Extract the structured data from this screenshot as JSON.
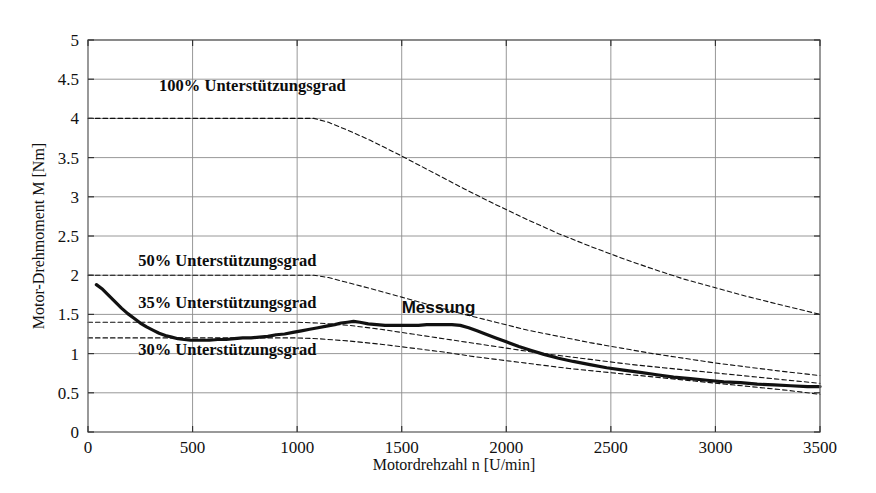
{
  "chart_data": {
    "type": "line",
    "title": "",
    "xlabel": "Motordrehzahl n [U/min]",
    "ylabel": "Motor-Drehmoment M [Nm]",
    "xlim": [
      0,
      3500
    ],
    "ylim": [
      0,
      5
    ],
    "xticks": [
      0,
      500,
      1000,
      1500,
      2000,
      2500,
      3000,
      3500
    ],
    "yticks": [
      0,
      0.5,
      1,
      1.5,
      2,
      2.5,
      3,
      3.5,
      4,
      4.5,
      5
    ],
    "xtick_labels": [
      "0",
      "500",
      "1000",
      "1500",
      "2000",
      "2500",
      "3000",
      "3500"
    ],
    "ytick_labels": [
      "0",
      "0.5",
      "1",
      "1.5",
      "2",
      "2.5",
      "3",
      "3.5",
      "4",
      "4.5",
      "5"
    ],
    "grid": true,
    "legend_position": "inline-annotations",
    "series": [
      {
        "name": "100% Unterstützungsgrad",
        "style": "dashed",
        "color": "#111111",
        "x": [
          0,
          200,
          400,
          600,
          800,
          1000,
          1080,
          1150,
          1250,
          1350,
          1500,
          1650,
          1800,
          1950,
          2100,
          2250,
          2400,
          2550,
          2700,
          2850,
          3000,
          3150,
          3300,
          3500
        ],
        "y": [
          4.0,
          4.0,
          4.0,
          4.0,
          4.0,
          4.0,
          4.0,
          3.95,
          3.84,
          3.72,
          3.52,
          3.31,
          3.1,
          2.9,
          2.71,
          2.53,
          2.37,
          2.22,
          2.08,
          1.95,
          1.84,
          1.73,
          1.63,
          1.5
        ]
      },
      {
        "name": "50% Unterstützungsgrad",
        "style": "dashed",
        "color": "#111111",
        "x": [
          0,
          200,
          400,
          600,
          800,
          1000,
          1080,
          1150,
          1250,
          1350,
          1500,
          1650,
          1800,
          1950,
          2100,
          2250,
          2400,
          2550,
          2700,
          2850,
          3000,
          3150,
          3300,
          3500
        ],
        "y": [
          2.0,
          2.0,
          2.0,
          2.0,
          2.0,
          2.0,
          2.0,
          1.97,
          1.9,
          1.83,
          1.72,
          1.61,
          1.5,
          1.4,
          1.3,
          1.22,
          1.14,
          1.07,
          1.0,
          0.94,
          0.88,
          0.83,
          0.78,
          0.72
        ]
      },
      {
        "name": "35% Unterstützungsgrad",
        "style": "dashed",
        "color": "#111111",
        "x": [
          0,
          200,
          400,
          600,
          800,
          1000,
          1100,
          1250,
          1400,
          1550,
          1700,
          1850,
          2000,
          2150,
          2300,
          2450,
          2600,
          2750,
          2900,
          3050,
          3200,
          3350,
          3500
        ],
        "y": [
          1.4,
          1.4,
          1.4,
          1.4,
          1.4,
          1.4,
          1.39,
          1.36,
          1.31,
          1.25,
          1.19,
          1.13,
          1.07,
          1.01,
          0.96,
          0.91,
          0.86,
          0.82,
          0.78,
          0.74,
          0.7,
          0.66,
          0.62
        ]
      },
      {
        "name": "30% Unterstützungsgrad",
        "style": "dashed",
        "color": "#111111",
        "x": [
          0,
          200,
          400,
          600,
          800,
          1000,
          1100,
          1250,
          1400,
          1550,
          1700,
          1850,
          2000,
          2150,
          2300,
          2450,
          2600,
          2750,
          2900,
          3050,
          3200,
          3350,
          3500
        ],
        "y": [
          1.2,
          1.2,
          1.2,
          1.2,
          1.2,
          1.2,
          1.19,
          1.16,
          1.12,
          1.07,
          1.02,
          0.96,
          0.91,
          0.86,
          0.81,
          0.77,
          0.73,
          0.69,
          0.65,
          0.61,
          0.57,
          0.53,
          0.48
        ]
      },
      {
        "name": "Messung",
        "style": "solid-thick",
        "color": "#111111",
        "x": [
          40,
          70,
          100,
          130,
          160,
          190,
          220,
          250,
          280,
          310,
          340,
          370,
          400,
          430,
          460,
          490,
          520,
          550,
          580,
          620,
          660,
          700,
          740,
          780,
          820,
          860,
          900,
          940,
          980,
          1020,
          1060,
          1100,
          1140,
          1180,
          1210,
          1240,
          1270,
          1300,
          1340,
          1380,
          1420,
          1460,
          1500,
          1540,
          1580,
          1620,
          1660,
          1700,
          1740,
          1780,
          1820,
          1860,
          1900,
          1950,
          2000,
          2060,
          2120,
          2180,
          2250,
          2320,
          2400,
          2480,
          2560,
          2640,
          2720,
          2800,
          2880,
          2960,
          3040,
          3120,
          3200,
          3280,
          3360,
          3440,
          3500
        ],
        "y": [
          1.88,
          1.82,
          1.74,
          1.66,
          1.58,
          1.51,
          1.45,
          1.39,
          1.34,
          1.3,
          1.26,
          1.23,
          1.21,
          1.19,
          1.18,
          1.17,
          1.17,
          1.17,
          1.17,
          1.18,
          1.18,
          1.19,
          1.2,
          1.2,
          1.21,
          1.22,
          1.24,
          1.25,
          1.27,
          1.29,
          1.31,
          1.33,
          1.35,
          1.37,
          1.39,
          1.4,
          1.41,
          1.4,
          1.38,
          1.37,
          1.36,
          1.36,
          1.36,
          1.36,
          1.36,
          1.37,
          1.37,
          1.37,
          1.37,
          1.36,
          1.33,
          1.29,
          1.25,
          1.2,
          1.15,
          1.09,
          1.04,
          0.99,
          0.94,
          0.9,
          0.86,
          0.82,
          0.79,
          0.76,
          0.73,
          0.7,
          0.68,
          0.66,
          0.64,
          0.63,
          0.61,
          0.6,
          0.59,
          0.58,
          0.58
        ]
      }
    ],
    "annotations": [
      {
        "text": "100% Unterstützungsgrad",
        "x": 340,
        "y": 4.35,
        "font": "serif-bold"
      },
      {
        "text": "50% Unterstützungsgrad",
        "x": 240,
        "y": 2.12,
        "font": "serif-bold"
      },
      {
        "text": "35% Unterstützungsgrad",
        "x": 240,
        "y": 1.58,
        "font": "serif-bold"
      },
      {
        "text": "30% Unterstützungsgrad",
        "x": 240,
        "y": 0.98,
        "font": "serif-bold"
      },
      {
        "text": "Messung",
        "x": 1500,
        "y": 1.52,
        "font": "sans-bold"
      }
    ]
  }
}
